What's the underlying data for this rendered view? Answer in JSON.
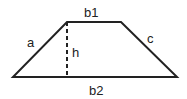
{
  "diagram": {
    "shape": "trapezoid",
    "labels": {
      "top_base": "b1",
      "bottom_base": "b2",
      "left_side": "a",
      "right_side": "c",
      "height": "h"
    },
    "colors": {
      "line": "#222222",
      "background": "#ffffff"
    }
  }
}
